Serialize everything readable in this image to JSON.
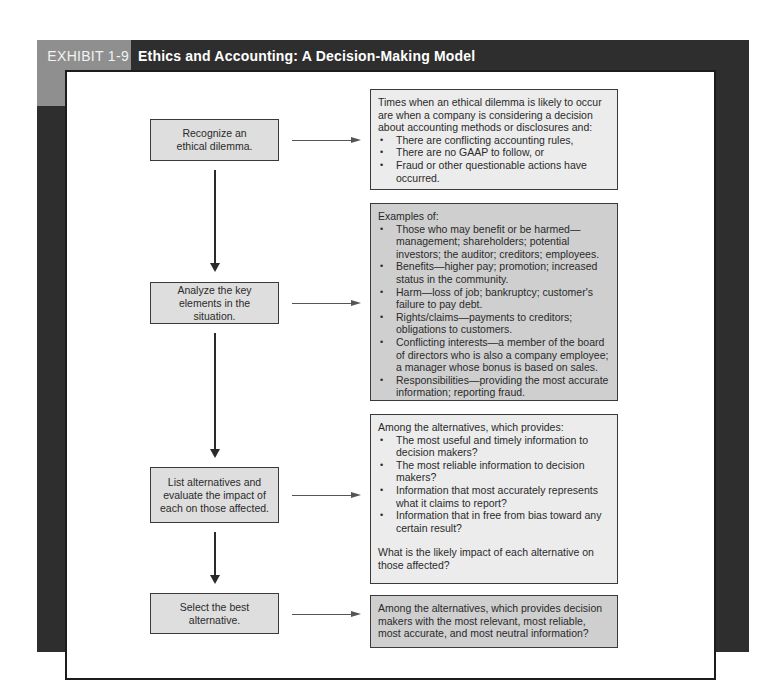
{
  "exhibit": {
    "label": "EXHIBIT 1-9",
    "title": "Ethics and Accounting: A Decision-Making Model"
  },
  "colors": {
    "frame": "#2e2e2e",
    "label_bg": "#8f8f8f",
    "step_fill": "#dedede",
    "detail_light_fill": "#ececec",
    "detail_dark_fill": "#cfcfcf"
  },
  "steps": [
    {
      "label": "Recognize an ethical dilemma."
    },
    {
      "label": "Analyze the key elements in the situation."
    },
    {
      "label": "List alternatives and evaluate the impact of each on those affected."
    },
    {
      "label": "Select the best alternative."
    }
  ],
  "details": [
    {
      "intro": "Times when an ethical dilemma is likely to occur are when a company is considering a decision about accounting methods or disclosures and:",
      "bullets": [
        "There are conflicting accounting rules,",
        "There are no GAAP to follow, or",
        "Fraud or other questionable actions have occurred."
      ]
    },
    {
      "intro": "Examples of:",
      "bullets": [
        "Those who may benefit or be harmed—management; shareholders; potential investors; the auditor; creditors; employees.",
        "Benefits—higher pay; promotion; increased status in the community.",
        "Harm—loss of job; bankruptcy; customer's failure to pay debt.",
        "Rights/claims—payments to creditors; obligations to customers.",
        "Conflicting interests—a member of the board of directors who is also a company employee; a manager whose bonus is based on sales.",
        "Responsibilities—providing the most accurate information; reporting fraud."
      ]
    },
    {
      "intro": "Among the alternatives, which provides:",
      "bullets": [
        "The most useful and timely information to decision makers?",
        "The most reliable information to decision makers?",
        "Information that most accurately represents what it claims to report?",
        "Information that in free from bias toward any certain result?"
      ],
      "outro": "What is the likely impact of each alternative on those affected?"
    },
    {
      "intro": "Among the alternatives, which provides decision makers with the most relevant, most reliable, most accurate, and most neutral information?"
    }
  ]
}
